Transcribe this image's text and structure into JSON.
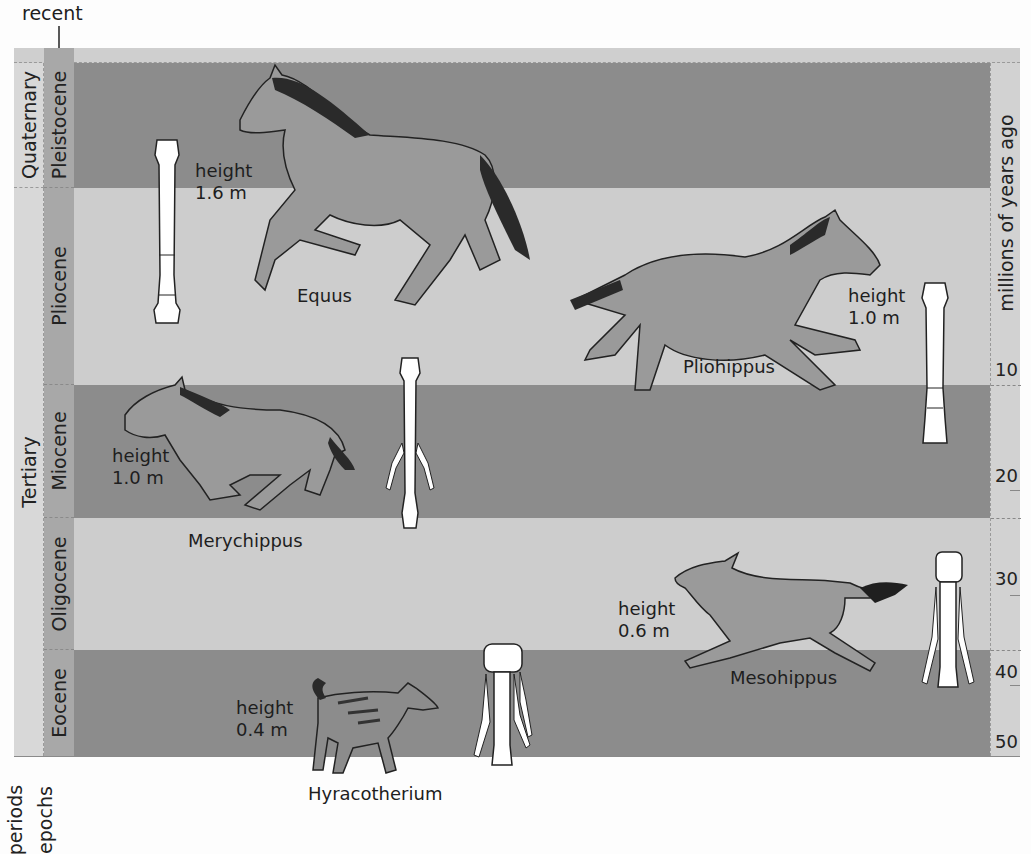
{
  "labels": {
    "recent": "recent",
    "axis_title": "millions of years ago",
    "periods_caption": "periods",
    "epochs_caption": "epochs"
  },
  "periods": [
    {
      "name": "Quaternary"
    },
    {
      "name": "Tertiary"
    }
  ],
  "epochs": [
    {
      "name": "Pleistocene",
      "shade": "dark"
    },
    {
      "name": "Pliocene",
      "shade": "light"
    },
    {
      "name": "Miocene",
      "shade": "dark"
    },
    {
      "name": "Oligocene",
      "shade": "light"
    },
    {
      "name": "Eocene",
      "shade": "dark"
    }
  ],
  "scale": {
    "ticks": [
      "10",
      "20",
      "30",
      "40",
      "50"
    ]
  },
  "animals": [
    {
      "name": "Equus",
      "height_label": "height",
      "height_value": "1.6 m"
    },
    {
      "name": "Pliohippus",
      "height_label": "height",
      "height_value": "1.0 m"
    },
    {
      "name": "Merychippus",
      "height_label": "height",
      "height_value": "1.0 m"
    },
    {
      "name": "Mesohippus",
      "height_label": "height",
      "height_value": "0.6 m"
    },
    {
      "name": "Hyracotherium",
      "height_label": "height",
      "height_value": "0.4 m"
    }
  ],
  "colors": {
    "band_dark": "#8c8c8c",
    "band_light": "#cdcdcd",
    "animal_fill": "#9a9a9a",
    "mane": "#2a2a2a",
    "bone": "#ffffff"
  }
}
